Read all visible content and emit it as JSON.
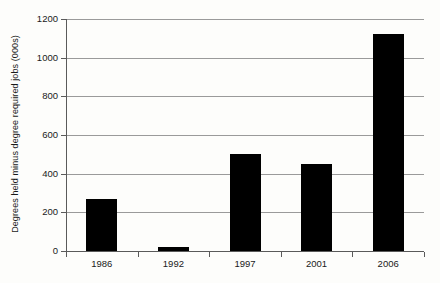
{
  "chart_data": {
    "type": "bar",
    "title": "",
    "xlabel": "",
    "ylabel": "Degrees held minus degree required jobs (000s)",
    "categories": [
      "1986",
      "1992",
      "1997",
      "2001",
      "2006"
    ],
    "values": [
      270,
      20,
      500,
      450,
      1120
    ],
    "ylim": [
      0,
      1200
    ],
    "ytick_labels": [
      "0",
      "200",
      "400",
      "600",
      "800",
      "1000",
      "1200"
    ],
    "ytick_values": [
      0,
      200,
      400,
      600,
      800,
      1000,
      1200
    ],
    "grid": true,
    "legend": "none",
    "bar_color": "#000000",
    "grid_color": "#9a9a9a",
    "axis_color": "#5a5a5a",
    "background_color": "#fdfdfb"
  }
}
